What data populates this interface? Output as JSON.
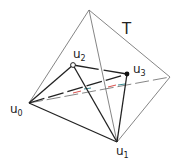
{
  "diagram": {
    "type": "tetrahedron-within-tetrahedron",
    "outer_label": "T",
    "vertices": {
      "u0": {
        "label": "u",
        "sub": "0",
        "x": 29,
        "y": 103,
        "marker": "none"
      },
      "u1": {
        "label": "u",
        "sub": "1",
        "x": 117,
        "y": 142,
        "marker": "none"
      },
      "u2": {
        "label": "u",
        "sub": "2",
        "x": 73,
        "y": 65,
        "marker": "open-circle"
      },
      "u3": {
        "label": "u",
        "sub": "3",
        "x": 127,
        "y": 74,
        "marker": "filled-circle"
      },
      "top": {
        "x": 89,
        "y": 10
      },
      "right": {
        "x": 170,
        "y": 77
      }
    },
    "colors": {
      "outer_edges": "#555555",
      "inner_edges": "#222222",
      "hidden_accent_red": "#d9534f",
      "hidden_accent_teal": "#3c8d93"
    }
  }
}
